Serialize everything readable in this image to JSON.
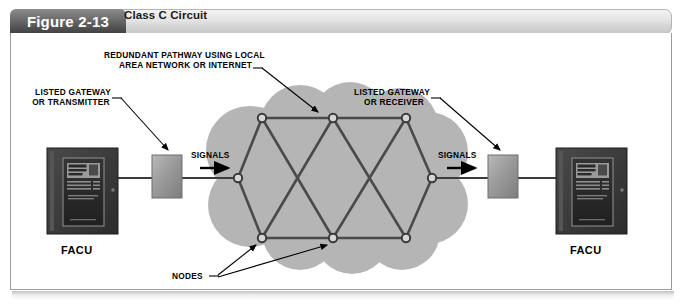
{
  "figure": {
    "number_label": "Figure 2-13",
    "caption": "Class C Circuit"
  },
  "callouts": {
    "redundant_pathway_line1": "REDUNDANT PATHWAY USING LOCAL",
    "redundant_pathway_line2": "AREA NETWORK OR INTERNET",
    "gateway_left_line1": "LISTED GATEWAY",
    "gateway_left_line2": "OR TRANSMITTER",
    "gateway_right_line1": "LISTED GATEWAY",
    "gateway_right_line2": "OR RECEIVER",
    "signals_left": "SIGNALS",
    "signals_right": "SIGNALS",
    "nodes": "NODES"
  },
  "devices": {
    "facu_left_label": "FACU",
    "facu_right_label": "FACU"
  },
  "diagram": {
    "type": "network-mesh-schematic",
    "cloud_label": "local area network or internet cloud",
    "node_count": 8,
    "nodes": [
      {
        "id": "n-left",
        "x": 238,
        "y": 178
      },
      {
        "id": "n-top-left",
        "x": 262,
        "y": 118
      },
      {
        "id": "n-top-mid",
        "x": 333,
        "y": 118
      },
      {
        "id": "n-top-right",
        "x": 406,
        "y": 118
      },
      {
        "id": "n-bot-left",
        "x": 262,
        "y": 238
      },
      {
        "id": "n-bot-mid",
        "x": 333,
        "y": 238
      },
      {
        "id": "n-bot-right",
        "x": 406,
        "y": 238
      },
      {
        "id": "n-right",
        "x": 432,
        "y": 178
      }
    ],
    "links": [
      [
        "n-left",
        "n-top-left"
      ],
      [
        "n-left",
        "n-bot-left"
      ],
      [
        "n-top-left",
        "n-top-mid"
      ],
      [
        "n-top-mid",
        "n-top-right"
      ],
      [
        "n-bot-left",
        "n-bot-mid"
      ],
      [
        "n-bot-mid",
        "n-bot-right"
      ],
      [
        "n-top-left",
        "n-bot-mid"
      ],
      [
        "n-bot-left",
        "n-top-mid"
      ],
      [
        "n-top-mid",
        "n-bot-right"
      ],
      [
        "n-bot-mid",
        "n-top-right"
      ],
      [
        "n-top-right",
        "n-right"
      ],
      [
        "n-bot-right",
        "n-right"
      ]
    ],
    "colors": {
      "cloud_fill": "#b5b5b5",
      "link_stroke": "#4a4a4a",
      "node_fill": "#d6d6d6",
      "gateway_box": "#8f8f8f",
      "facu_cabinet": "#3a3a3a",
      "tab_dark": "#545454",
      "caption_gray": "#dcdcdc"
    }
  }
}
